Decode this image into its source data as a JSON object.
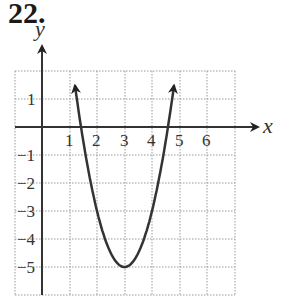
{
  "problem": {
    "number": "22."
  },
  "chart_data": {
    "type": "line",
    "title": "",
    "xlabel": "x",
    "ylabel": "y",
    "xlim": [
      -1,
      7
    ],
    "ylim": [
      -6,
      2
    ],
    "grid": true,
    "grid_style": "dotted",
    "x_ticks": [
      "1",
      "2",
      "3",
      "4",
      "5",
      "6"
    ],
    "y_ticks": [
      "1",
      "−1",
      "−2",
      "−3",
      "−4",
      "−5"
    ],
    "series": [
      {
        "name": "parabola",
        "equation": "y = 2(x − 3)^2 − 5",
        "vertex": [
          3,
          -5
        ],
        "x_intercepts": [
          1.42,
          4.58
        ],
        "x": [
          1.2,
          1.5,
          2,
          2.5,
          3,
          3.5,
          4,
          4.5,
          4.8
        ],
        "values": [
          1.48,
          -0.5,
          -3,
          -4.5,
          -5,
          -4.5,
          -3,
          -0.5,
          1.48
        ],
        "arrows_at_ends": true,
        "color": "#333333"
      }
    ]
  }
}
